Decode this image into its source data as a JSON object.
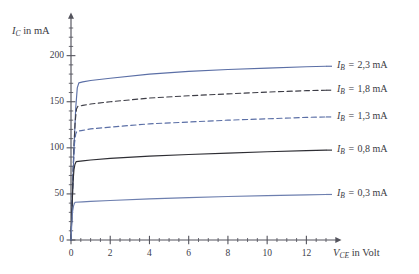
{
  "chart_data": {
    "type": "line",
    "title": "",
    "subtitle": "",
    "xlabel": "V_CE in Volt",
    "ylabel": "I_C in mA",
    "xlabel_parts": {
      "symbol": "V",
      "subscript": "CE",
      "rest": "in Volt"
    },
    "ylabel_parts": {
      "symbol": "I",
      "subscript": "C",
      "rest": "in mA"
    },
    "xlim": [
      0,
      13
    ],
    "ylim": [
      0,
      230
    ],
    "grid": false,
    "legend_position": "right-inline",
    "x_major_ticks": [
      0,
      2,
      4,
      6,
      8,
      10,
      12
    ],
    "x_tick_labels": [
      "0",
      "2",
      "4",
      "6",
      "8",
      "10",
      "12"
    ],
    "x_minor_step": 0.5,
    "y_major_ticks": [
      0,
      50,
      100,
      150,
      200
    ],
    "y_tick_labels": [
      "0",
      "50",
      "100",
      "150",
      "200"
    ],
    "y_minor_step": 10,
    "axis_arrow_x": true,
    "axis_arrow_y": true,
    "series": [
      {
        "name": "I_B = 2,3 mA",
        "label_symbol": "I",
        "label_subscript": "B",
        "label_value": "2,3",
        "label_unit": "mA",
        "style": "solid",
        "color": "#5b6fa6",
        "knee_x": 0.38,
        "saturation_start": 170,
        "saturation_end": 188,
        "x": [
          0,
          0.08,
          0.16,
          0.24,
          0.32,
          0.4,
          0.6,
          1.0,
          2.0,
          4.0,
          6.0,
          8.0,
          10.0,
          12.0,
          13.0
        ],
        "y": [
          0,
          52,
          104,
          143,
          165,
          170.5,
          171.5,
          173,
          175.5,
          180,
          183,
          185,
          186.5,
          188,
          188.5
        ]
      },
      {
        "name": "I_B = 1,8 mA",
        "label_symbol": "I",
        "label_subscript": "B",
        "label_value": "1,8",
        "label_unit": "mA",
        "style": "dashed",
        "color": "#3d3d46",
        "knee_x": 0.33,
        "saturation_start": 145,
        "saturation_end": 162,
        "x": [
          0,
          0.07,
          0.14,
          0.21,
          0.28,
          0.35,
          0.6,
          1.0,
          2.0,
          4.0,
          6.0,
          8.0,
          10.0,
          12.0,
          13.0
        ],
        "y": [
          0,
          48,
          96,
          128,
          142,
          145,
          146,
          147.5,
          150,
          154,
          156.5,
          158.5,
          160.5,
          162,
          162.5
        ]
      },
      {
        "name": "I_B = 1,3 mA",
        "label_symbol": "I",
        "label_subscript": "B",
        "label_value": "1,3",
        "label_unit": "mA",
        "style": "dashed",
        "color": "#5b6fa6",
        "knee_x": 0.3,
        "saturation_start": 118,
        "saturation_end": 133,
        "x": [
          0,
          0.06,
          0.12,
          0.18,
          0.24,
          0.3,
          0.6,
          1.0,
          2.0,
          4.0,
          6.0,
          8.0,
          10.0,
          12.0,
          13.0
        ],
        "y": [
          0,
          42,
          82,
          105,
          115,
          118,
          119,
          120.5,
          122.5,
          126,
          128,
          130,
          131.5,
          133,
          133.5
        ]
      },
      {
        "name": "I_B = 0,8 mA",
        "label_symbol": "I",
        "label_subscript": "B",
        "label_value": "0,8",
        "label_unit": "mA",
        "style": "solid",
        "color": "#2e2e34",
        "knee_x": 0.26,
        "saturation_start": 85,
        "saturation_end": 97,
        "x": [
          0,
          0.05,
          0.1,
          0.15,
          0.2,
          0.26,
          0.6,
          1.0,
          2.0,
          4.0,
          6.0,
          8.0,
          10.0,
          12.0,
          13.0
        ],
        "y": [
          0,
          33,
          62,
          76,
          82,
          85,
          85.8,
          86.8,
          88.5,
          91,
          92.8,
          94.3,
          95.8,
          97,
          97.5
        ]
      },
      {
        "name": "I_B = 0,3 mA",
        "label_symbol": "I",
        "label_subscript": "B",
        "label_value": "0,3",
        "label_unit": "mA",
        "style": "solid",
        "color": "#6d7faf",
        "knee_x": 0.22,
        "saturation_start": 41,
        "saturation_end": 49,
        "x": [
          0,
          0.04,
          0.08,
          0.13,
          0.18,
          0.22,
          0.6,
          1.0,
          2.0,
          4.0,
          6.0,
          8.0,
          10.0,
          12.0,
          13.0
        ],
        "y": [
          0,
          18,
          31,
          37,
          40,
          41,
          41.4,
          41.9,
          42.9,
          44.6,
          46.0,
          47.2,
          48.2,
          49,
          49.4
        ]
      }
    ]
  },
  "axes": {
    "y_title_symbol": "I",
    "y_title_sub": "C",
    "y_title_rest": "in mA",
    "x_title_symbol": "V",
    "x_title_sub": "CE",
    "x_title_rest": "in Volt"
  },
  "ticks": {
    "y": [
      "200",
      "150",
      "100",
      "50",
      "0"
    ],
    "x": [
      "0",
      "2",
      "4",
      "6",
      "8",
      "10",
      "12"
    ]
  },
  "legend": [
    {
      "symbol": "I",
      "sub": "B",
      "value": "2,3",
      "unit": "mA"
    },
    {
      "symbol": "I",
      "sub": "B",
      "value": "1,8",
      "unit": "mA"
    },
    {
      "symbol": "I",
      "sub": "B",
      "value": "1,3",
      "unit": "mA"
    },
    {
      "symbol": "I",
      "sub": "B",
      "value": "0,8",
      "unit": "mA"
    },
    {
      "symbol": "I",
      "sub": "B",
      "value": "0,3",
      "unit": "mA"
    }
  ],
  "colors": {
    "blue": "#5b6fa6",
    "light_blue": "#6d7faf",
    "dark": "#2e2e34",
    "axis": "#53535c",
    "background": "#ffffff"
  }
}
